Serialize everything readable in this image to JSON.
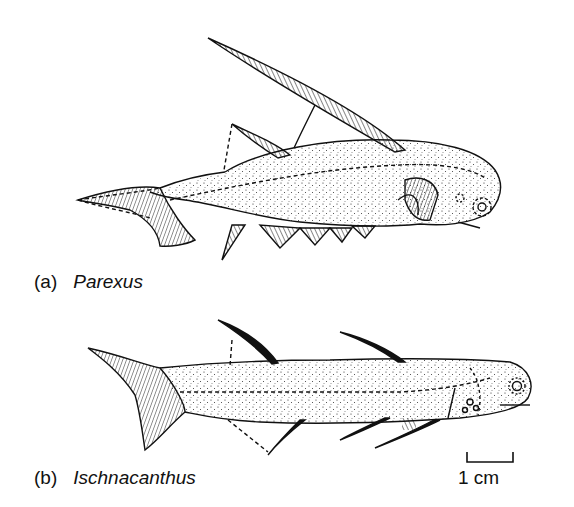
{
  "figure": {
    "panels": [
      {
        "letter": "(a)",
        "name": "Parexus"
      },
      {
        "letter": "(b)",
        "name": "Ischnacanthus"
      }
    ],
    "scale_bar": {
      "label": "1 cm"
    },
    "colors": {
      "ink": "#111111",
      "background": "#ffffff"
    }
  }
}
